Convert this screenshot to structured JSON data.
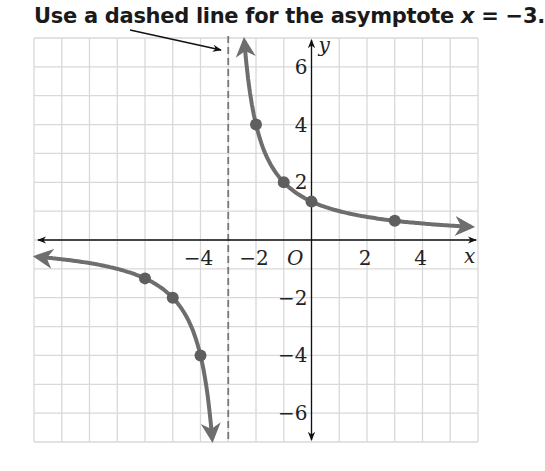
{
  "caption": {
    "text_before": "Use a dashed line for the asymptote ",
    "math": "x",
    "text_after": " = −3."
  },
  "chart_data": {
    "type": "line",
    "title": "Use a dashed line for the asymptote x = −3.",
    "function": "y = 4/(x + 3)",
    "xlabel": "x",
    "ylabel": "y",
    "origin_label": "O",
    "xlim": [
      -10,
      6
    ],
    "ylim": [
      -7,
      7
    ],
    "grid": true,
    "x_ticks": [
      -4,
      -2,
      2,
      4
    ],
    "x_tick_labels": [
      "−4",
      "−2",
      "2",
      "4"
    ],
    "y_ticks": [
      6,
      4,
      2,
      -2,
      -4,
      -6
    ],
    "y_tick_labels": [
      "6",
      "4",
      "2",
      "−2",
      "−4",
      "−6"
    ],
    "asymptotes": [
      {
        "type": "vertical",
        "x": -3,
        "style": "dashed",
        "annotation": "Use a dashed line for the asymptote x = −3."
      }
    ],
    "series": [
      {
        "name": "right branch",
        "x": [
          -2,
          -1,
          0,
          3
        ],
        "y": [
          4,
          2,
          1.33,
          0.67
        ]
      },
      {
        "name": "left branch",
        "x": [
          -6,
          -5,
          -4
        ],
        "y": [
          -1.33,
          -2,
          -4
        ]
      }
    ],
    "colors": {
      "curve": "#6e6e6e",
      "points": "#5f5f5f",
      "grid": "#d9d9d9",
      "axes": "#111111",
      "asymptote": "#777777"
    }
  }
}
